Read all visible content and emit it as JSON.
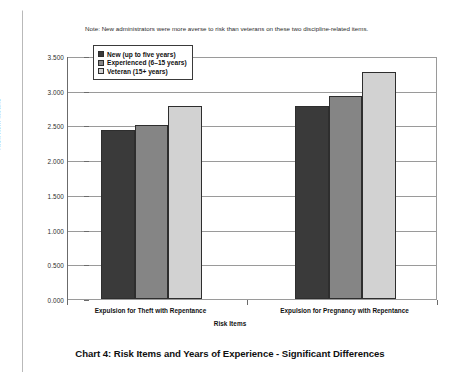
{
  "note": "Note: New administrators were more averse to risk than veterans on these two discipline-related items.",
  "caption": "Chart 4: Risk Items and Years of Experience - Significant Differences",
  "legend": {
    "entries": [
      {
        "label": "New (up to five years)",
        "color": "#3a3a3a"
      },
      {
        "label": "Experienced (6–15 years)",
        "color": "#858585"
      },
      {
        "label": "Veteran (15+ years)",
        "color": "#d2d2d2"
      }
    ]
  },
  "axes": {
    "y_title": "Risk Item Means",
    "x_title": "Risk Items",
    "y_ticks": [
      "0.000",
      "0.500",
      "1.000",
      "1.500",
      "2.000",
      "2.500",
      "3.000",
      "3.500"
    ]
  },
  "chart_data": {
    "type": "bar",
    "title": "Chart 4: Risk Items and Years of Experience - Significant Differences",
    "xlabel": "Risk Items",
    "ylabel": "Risk Item Means",
    "ylim": [
      0,
      3.5
    ],
    "ytick_step": 0.5,
    "grid": true,
    "legend_position": "top-left inside plot",
    "categories": [
      "Expulsion for Theft with Repentance",
      "Expulsion for Pregnancy with Repentance"
    ],
    "series": [
      {
        "name": "New (up to five years)",
        "color": "#3a3a3a",
        "values": [
          2.44,
          2.78
        ]
      },
      {
        "name": "Experienced (6–15 years)",
        "color": "#858585",
        "values": [
          2.51,
          2.93
        ]
      },
      {
        "name": "Veteran (15+ years)",
        "color": "#d2d2d2",
        "values": [
          2.78,
          3.27
        ]
      }
    ],
    "annotation": "Note: New administrators were more averse to risk than veterans on these two discipline-related items."
  }
}
